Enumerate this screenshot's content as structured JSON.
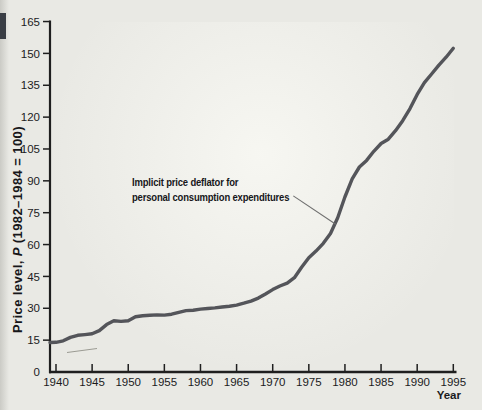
{
  "page": {
    "background": "#e9e9e4",
    "glare": "#fafaf5"
  },
  "chart_data": {
    "type": "line",
    "title": "",
    "xlabel": "Year",
    "ylabel": "Price level, P (1982–1984 = 100)",
    "ylabel_parts": {
      "prefix": "Price level, ",
      "variable": "P",
      "suffix": " (1982–1984 = 100)"
    },
    "x_ticks": [
      1940,
      1945,
      1950,
      1955,
      1960,
      1965,
      1970,
      1975,
      1980,
      1985,
      1990,
      1995
    ],
    "y_ticks": [
      0,
      15,
      30,
      45,
      60,
      75,
      90,
      105,
      120,
      135,
      150,
      165
    ],
    "xlim": [
      1939,
      1995.5
    ],
    "ylim": [
      0,
      165
    ],
    "grid": false,
    "legend": "none",
    "series": [
      {
        "name": "Implicit price deflator for personal consumption expenditures",
        "x": [
          1939,
          1940,
          1941,
          1942,
          1943,
          1944,
          1945,
          1946,
          1947,
          1948,
          1949,
          1950,
          1951,
          1952,
          1953,
          1954,
          1955,
          1956,
          1957,
          1958,
          1959,
          1960,
          1961,
          1962,
          1963,
          1964,
          1965,
          1966,
          1967,
          1968,
          1969,
          1970,
          1971,
          1972,
          1973,
          1974,
          1975,
          1976,
          1977,
          1978,
          1979,
          1980,
          1981,
          1982,
          1983,
          1984,
          1985,
          1986,
          1987,
          1988,
          1989,
          1990,
          1991,
          1992,
          1993,
          1994,
          1995
        ],
        "values": [
          13.9,
          14.0,
          14.7,
          16.3,
          17.3,
          17.6,
          18.0,
          19.5,
          22.3,
          24.1,
          23.8,
          24.1,
          26.0,
          26.5,
          26.7,
          26.9,
          26.8,
          27.2,
          28.1,
          28.9,
          29.1,
          29.6,
          29.9,
          30.2,
          30.6,
          31.0,
          31.5,
          32.4,
          33.4,
          34.8,
          36.7,
          38.8,
          40.5,
          41.8,
          44.4,
          49.3,
          53.8,
          56.9,
          60.6,
          65.2,
          72.6,
          82.4,
          90.9,
          96.5,
          99.6,
          103.9,
          107.6,
          109.6,
          113.6,
          118.3,
          124.0,
          130.7,
          136.2,
          140.3,
          144.5,
          148.2,
          152.4
        ]
      }
    ],
    "annotation": {
      "line1": "Implicit price deflator for",
      "line2": "personal consumption expenditures",
      "points_to": {
        "year": 1979,
        "value": 70
      }
    },
    "colors": {
      "curve": "#54555a",
      "axis": "#1f1f1f",
      "text": "#1b1b1d",
      "leader": "#6f6f6f",
      "artifact": "#9b9b93"
    }
  }
}
